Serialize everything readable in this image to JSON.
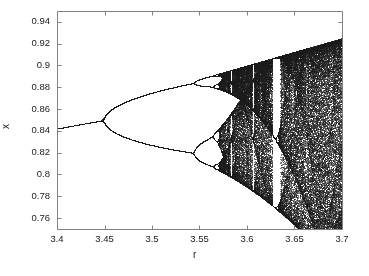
{
  "figure": {
    "background_color": "#ffffff",
    "point_color": "#1a1a1a",
    "axis_color": "#808080",
    "text_color": "#1a1a1a"
  },
  "chart_data": {
    "type": "scatter",
    "title": "",
    "subtitle": "",
    "xlabel": "r",
    "ylabel": "x",
    "xlim": [
      3.4,
      3.7
    ],
    "ylim": [
      0.75,
      0.95
    ],
    "xticks": [
      3.4,
      3.45,
      3.5,
      3.55,
      3.6,
      3.65,
      3.7
    ],
    "xtick_labels": [
      "3.4",
      "3.45",
      "3.5",
      "3.55",
      "3.6",
      "3.65",
      "3.7"
    ],
    "yticks": [
      0.76,
      0.78,
      0.8,
      0.82,
      0.84,
      0.86,
      0.88,
      0.9,
      0.92,
      0.94
    ],
    "ytick_labels": [
      "0.76",
      "0.78",
      "0.8",
      "0.82",
      "0.84",
      "0.86",
      "0.88",
      "0.9",
      "0.92",
      "0.94"
    ],
    "grid": false,
    "legend": null,
    "map": {
      "equation": "x_{n+1} = r * x_n * (1 - x_n)",
      "x0": 0.5,
      "transient_iterations": 400,
      "plot_iterations": 260,
      "r_samples": 1400
    },
    "features": {
      "period_1_branch_value_at_3_40": 0.8424,
      "period_2_bifurcation_r": 3.4495,
      "period_4_bifurcation_r": 3.5441,
      "period_8_bifurcation_r": 3.5644,
      "chaos_onset_r": 3.5699,
      "period_3_window_r": 3.6285,
      "upper_envelope_at_3_70": 0.925,
      "lower_envelope_at_3_70": 0.7475
    },
    "annotations": []
  },
  "axes": {
    "plot_left_px": 57,
    "plot_right_px": 342,
    "plot_top_px": 11,
    "plot_bottom_px": 229
  }
}
